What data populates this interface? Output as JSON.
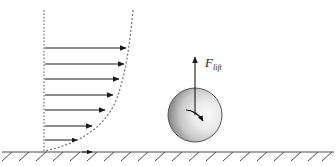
{
  "figure": {
    "kind": "fluid-flow-lift-diagram",
    "background_color": "#ffffff",
    "width": 336,
    "height": 166
  },
  "labels": {
    "force_symbol": "F",
    "force_subscript": "lift"
  },
  "velocity_profile": {
    "axis": {
      "name": "vertical-reference-axis",
      "style": "dashed",
      "color": "#555555",
      "x": 44,
      "y_top": 10,
      "y_bottom": 151
    },
    "curve": {
      "name": "boundary-layer-profile-curve",
      "style": "dashed",
      "color": "#666666",
      "description": "velocity profile, near vertical at top, curving to meet the ground"
    },
    "arrow_color": "#1a1a1a",
    "arrows": [
      {
        "y": 48,
        "x_start": 45,
        "x_end": 126
      },
      {
        "y": 64,
        "x_start": 45,
        "x_end": 124
      },
      {
        "y": 79,
        "x_start": 45,
        "x_end": 119
      },
      {
        "y": 95,
        "x_start": 45,
        "x_end": 113
      },
      {
        "y": 110,
        "x_start": 45,
        "x_end": 105
      },
      {
        "y": 126,
        "x_start": 45,
        "x_end": 92
      },
      {
        "y": 140,
        "x_start": 45,
        "x_end": 77
      }
    ]
  },
  "ground": {
    "name": "ground-surface",
    "color": "#4a4a4a",
    "y": 152,
    "x_start": 2,
    "x_end": 334,
    "hatch_count": 20,
    "surface_arrow_x": 90
  },
  "sphere": {
    "name": "rotating-sphere",
    "center_x": 195,
    "center_y": 115,
    "radius": 27,
    "outline_color": "#555555",
    "gradient_dark": "#3d3d3d",
    "gradient_light": "#f2f2f2",
    "rotation": "clockwise"
  },
  "force_arrow": {
    "name": "lift-force-arrow",
    "color": "#1a1a1a",
    "x": 195,
    "y_start": 115,
    "y_end": 57,
    "label_x": 205,
    "label_y": 65
  }
}
